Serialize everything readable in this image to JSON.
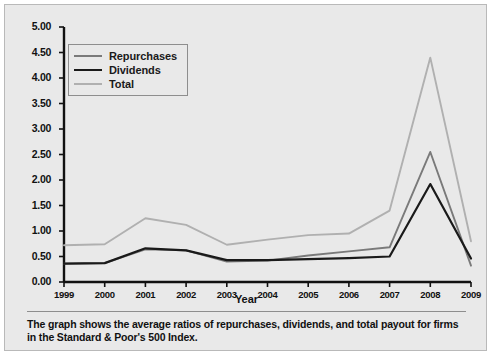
{
  "chart_data": {
    "type": "line",
    "title": "",
    "xlabel": "Year",
    "ylabel": "",
    "categories": [
      "1999",
      "2000",
      "2001",
      "2002",
      "2003",
      "2004",
      "2005",
      "2006",
      "2007",
      "2008",
      "2009"
    ],
    "x": [
      1999,
      2000,
      2001,
      2002,
      2003,
      2004,
      2005,
      2006,
      2007,
      2008,
      2009
    ],
    "ylim": [
      0.0,
      5.0
    ],
    "ytick_step": 0.5,
    "yticks": [
      "0.00",
      "0.50",
      "1.00",
      "1.50",
      "2.00",
      "2.50",
      "3.00",
      "3.50",
      "4.00",
      "4.50",
      "5.00"
    ],
    "grid": false,
    "legend_position": "upper-left-inside",
    "series": [
      {
        "name": "Repurchases",
        "color": "#7a7a7a",
        "values": [
          0.36,
          0.37,
          0.64,
          0.62,
          0.4,
          0.42,
          0.52,
          0.6,
          0.68,
          2.55,
          0.32
        ]
      },
      {
        "name": "Dividends",
        "color": "#1a1a1a",
        "values": [
          0.36,
          0.37,
          0.66,
          0.62,
          0.43,
          0.43,
          0.45,
          0.47,
          0.5,
          1.92,
          0.46
        ]
      },
      {
        "name": "Total",
        "color": "#b0b0b0",
        "values": [
          0.72,
          0.74,
          1.25,
          1.12,
          0.73,
          0.83,
          0.92,
          0.95,
          1.4,
          4.4,
          0.8
        ]
      }
    ]
  },
  "legend": {
    "items": [
      {
        "label": "Repurchases"
      },
      {
        "label": "Dividends"
      },
      {
        "label": "Total"
      }
    ]
  },
  "axis": {
    "x_title": "Year"
  },
  "caption": {
    "text": "The graph shows the average ratios of repurchases, dividends, and total payout for firms in the Standard & Poor's 500 Index."
  },
  "colors": {
    "figure_background": "#e9e9e9",
    "axis": "#111111",
    "repurchases": "#7a7a7a",
    "dividends": "#1a1a1a",
    "total": "#b0b0b0"
  }
}
